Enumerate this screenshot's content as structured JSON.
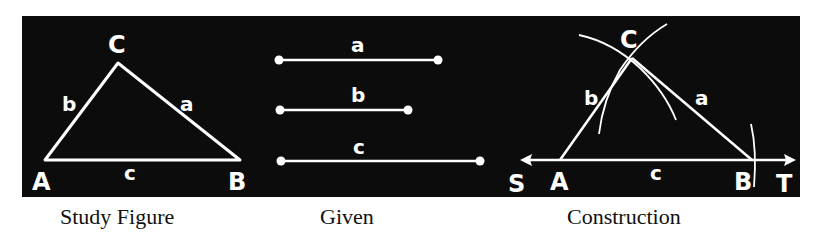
{
  "colors": {
    "background": "#0c0c0c",
    "stroke": "#ffffff",
    "page": "#ffffff",
    "caption": "#111111"
  },
  "study_figure": {
    "caption": "Study Figure",
    "vertices": {
      "A": "A",
      "B": "B",
      "C": "C"
    },
    "sides": {
      "a": "a",
      "b": "b",
      "c": "c"
    }
  },
  "given": {
    "caption": "Given",
    "segments": [
      {
        "label": "a"
      },
      {
        "label": "b"
      },
      {
        "label": "c"
      }
    ]
  },
  "construction": {
    "caption": "Construction",
    "vertices": {
      "A": "A",
      "B": "B",
      "C": "C"
    },
    "sides": {
      "a": "a",
      "b": "b",
      "c": "c"
    },
    "line_ends": {
      "S": "S",
      "T": "T"
    }
  }
}
